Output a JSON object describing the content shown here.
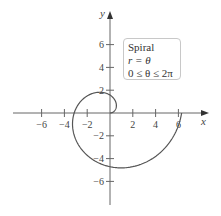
{
  "chart_data": {
    "type": "line",
    "title": "Spiral",
    "equation": "r = θ",
    "domain": "0 ≤ θ ≤ 2π",
    "xlabel": "x",
    "ylabel": "y",
    "xlim": [
      -7.5,
      8.5
    ],
    "ylim": [
      -8,
      8.5
    ],
    "xticks": [
      -6,
      -4,
      -2,
      2,
      4,
      6
    ],
    "yticks": [
      -6,
      -4,
      -2,
      2,
      4,
      6
    ],
    "grid": false,
    "legend_position": "upper right",
    "series": [
      {
        "name": "r = θ",
        "param": "theta",
        "theta_range": [
          0,
          6.2832
        ]
      }
    ]
  },
  "legend": {
    "line1": "Spiral",
    "line2": "r = θ",
    "line3": "0 ≤ θ ≤ 2π"
  },
  "axes": {
    "x_label": "x",
    "y_label": "y",
    "x_ticks": [
      "−6",
      "−4",
      "−2",
      "2",
      "4",
      "6"
    ],
    "y_ticks": [
      "6",
      "4",
      "2",
      "−2",
      "−4",
      "−6"
    ]
  }
}
